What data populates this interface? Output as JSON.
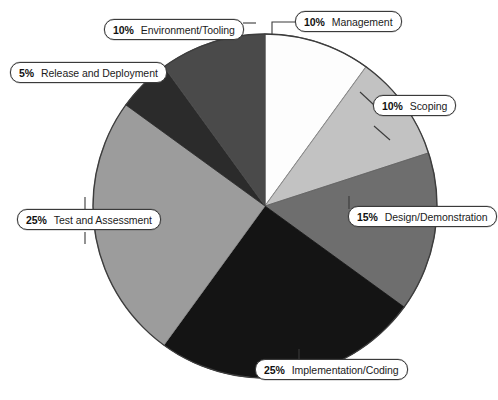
{
  "chart_data": {
    "type": "pie",
    "title": "",
    "subtitle": "",
    "xlabel": "",
    "ylabel": "",
    "legend_position": "callout-labels",
    "grid": false,
    "total": 100,
    "units": "%",
    "start_angle_deg": 0,
    "direction": "clockwise",
    "categories": [
      "Management",
      "Scoping",
      "Design/Demonstration",
      "Implementation/Coding",
      "Test and Assessment",
      "Release and Deployment",
      "Environment/Tooling"
    ],
    "values": [
      10,
      10,
      15,
      25,
      25,
      5,
      10
    ],
    "colors": [
      "#fdfdfd",
      "#c2c2c2",
      "#6e6e6e",
      "#141414",
      "#9c9c9c",
      "#2b2b2b",
      "#4a4a4a"
    ],
    "slices": [
      {
        "label": "Management",
        "percent_text": "10%",
        "value": 10,
        "color": "#fdfdfd",
        "start_deg": 0,
        "end_deg": 36
      },
      {
        "label": "Scoping",
        "percent_text": "10%",
        "value": 10,
        "color": "#c2c2c2",
        "start_deg": 36,
        "end_deg": 72
      },
      {
        "label": "Design/Demonstration",
        "percent_text": "15%",
        "value": 15,
        "color": "#6e6e6e",
        "start_deg": 72,
        "end_deg": 126
      },
      {
        "label": "Implementation/Coding",
        "percent_text": "25%",
        "value": 25,
        "color": "#141414",
        "start_deg": 126,
        "end_deg": 216
      },
      {
        "label": "Test and Assessment",
        "percent_text": "25%",
        "value": 25,
        "color": "#9c9c9c",
        "start_deg": 216,
        "end_deg": 306
      },
      {
        "label": "Release and Deployment",
        "percent_text": "5%",
        "value": 5,
        "color": "#2b2b2b",
        "start_deg": 306,
        "end_deg": 324
      },
      {
        "label": "Environment/Tooling",
        "percent_text": "10%",
        "value": 10,
        "color": "#4a4a4a",
        "start_deg": 324,
        "end_deg": 360
      }
    ]
  },
  "callouts": {
    "management": {
      "pct": "10%",
      "label": "Management"
    },
    "scoping": {
      "pct": "10%",
      "label": "Scoping"
    },
    "design": {
      "pct": "15%",
      "label": "Design/Demonstration"
    },
    "implementation": {
      "pct": "25%",
      "label": "Implementation/Coding"
    },
    "test": {
      "pct": "25%",
      "label": "Test and Assessment"
    },
    "release": {
      "pct": "5%",
      "label": "Release and Deployment"
    },
    "environment": {
      "pct": "10%",
      "label": "Environment/Tooling"
    }
  }
}
